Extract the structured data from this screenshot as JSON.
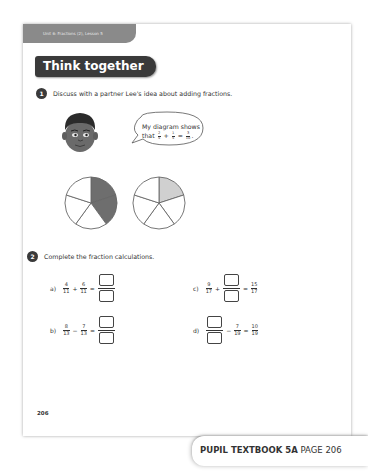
{
  "header": {
    "unit_lesson": "Unit 6: Fractions (2), Lesson 5",
    "section_title": "Think together"
  },
  "question1": {
    "number": "1",
    "prompt": "Discuss with a partner Lee's idea about adding fractions.",
    "speech": {
      "line1": "My diagram shows",
      "line2_prefix": "that",
      "frac1": {
        "num": "2",
        "den": "5"
      },
      "op1": "+",
      "frac2": {
        "num": "1",
        "den": "5"
      },
      "eq": "=",
      "frac3": {
        "num": "3",
        "den": "10"
      },
      "suffix": "."
    },
    "diagrams": [
      {
        "segments": 5,
        "shaded": 2,
        "shade_color": "#6e6e6e"
      },
      {
        "segments": 5,
        "shaded": 1,
        "shade_color": "#d0d0d0"
      }
    ]
  },
  "question2": {
    "number": "2",
    "prompt": "Complete the fraction calculations.",
    "items": [
      {
        "label": "a)",
        "a": {
          "num": "4",
          "den": "11"
        },
        "op": "+",
        "b": {
          "num": "6",
          "den": "11"
        },
        "eq": "="
      },
      {
        "label": "b)",
        "a": {
          "num": "8",
          "den": "13"
        },
        "op": "−",
        "b": {
          "num": "7",
          "den": "13"
        },
        "eq": "="
      },
      {
        "label": "c)",
        "a": {
          "num": "9",
          "den": "17"
        },
        "op": "+",
        "eq": "=",
        "result": {
          "num": "15",
          "den": "17"
        }
      },
      {
        "label": "d)",
        "op": "−",
        "b": {
          "num": "7",
          "den": "19"
        },
        "eq": "=",
        "result": {
          "num": "10",
          "den": "19"
        }
      }
    ]
  },
  "footer": {
    "page_number": "206",
    "book_label": "PUPIL TEXTBOOK 5A",
    "page_label": "PAGE 206"
  }
}
